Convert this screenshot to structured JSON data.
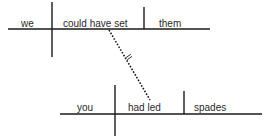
{
  "diagram": {
    "type": "sentence-diagram",
    "main_clause": {
      "subject": "we",
      "verb": "could have set",
      "object": "them"
    },
    "subordinate_clause": {
      "subject": "you",
      "verb": "had led",
      "object": "spades"
    },
    "connector": {
      "style": "dotted",
      "label_symbol": "="
    }
  }
}
